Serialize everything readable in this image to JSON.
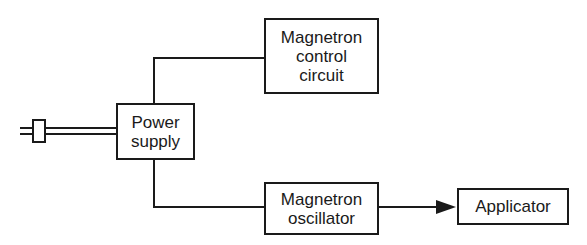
{
  "diagram": {
    "type": "block-diagram",
    "nodes": {
      "power_supply": {
        "lines": [
          "Power",
          "supply"
        ]
      },
      "magnetron_control": {
        "lines": [
          "Magnetron",
          "control",
          "circuit"
        ]
      },
      "magnetron_oscillator": {
        "lines": [
          "Magnetron",
          "oscillator"
        ]
      },
      "applicator": {
        "lines": [
          "Applicator"
        ]
      }
    },
    "edges": [
      {
        "from": "plug",
        "to": "power_supply",
        "style": "double-line"
      },
      {
        "from": "power_supply",
        "to": "magnetron_control",
        "style": "line"
      },
      {
        "from": "power_supply",
        "to": "magnetron_oscillator",
        "style": "line"
      },
      {
        "from": "magnetron_oscillator",
        "to": "applicator",
        "style": "arrow"
      }
    ],
    "line_color": "#1a1a1a"
  }
}
